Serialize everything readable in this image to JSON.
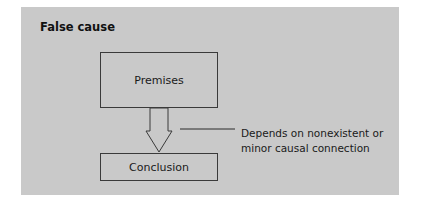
{
  "diagram": {
    "title": "False cause",
    "nodes": {
      "premises": "Premises",
      "conclusion": "Conclusion"
    },
    "annotation": {
      "line1": "Depends on nonexistent or",
      "line2": "minor causal connection"
    },
    "colors": {
      "panel": "#c9c9c9",
      "stroke": "#3a3a3a"
    }
  }
}
